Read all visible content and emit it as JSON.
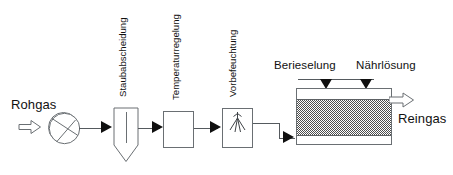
{
  "diagram": {
    "stream_labels": {
      "inlet": "Rohgas",
      "outlet": "Reingas"
    },
    "stage_labels": [
      {
        "id": "staubabscheidung",
        "label": "Staubabscheidung"
      },
      {
        "id": "temperaturregelung",
        "label": "Temperaturregelung"
      },
      {
        "id": "vorbefeuchtung",
        "label": "Vorbefeuchtung"
      }
    ],
    "filter_inputs": [
      {
        "id": "berieselung",
        "label": "Berieselung"
      },
      {
        "id": "naehrloesung",
        "label": "Nährlösung"
      }
    ],
    "icons": {
      "inlet_arrow": "hollow-arrow-right-icon",
      "outlet_arrow": "hollow-arrow-right-icon",
      "flow_arrow": "solid-triangle-right-icon",
      "feed_arrow": "solid-triangle-down-icon",
      "blower": "fan-blower-icon",
      "cyclone": "cyclone-separator-icon",
      "heat_exchanger": "rectangle-unit-icon",
      "humidifier": "spray-nozzle-icon",
      "biofilter": "filter-bed-icon"
    },
    "colors": {
      "line": "#6a6f73",
      "arrow": "#101010",
      "bed_fill": "#4e4e4e",
      "background": "#ffffff",
      "text": "#111111"
    }
  }
}
